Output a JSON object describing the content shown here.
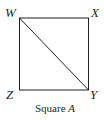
{
  "figure": {
    "shape": "square",
    "vertices": {
      "top_left": "W",
      "top_right": "X",
      "bottom_left": "Z",
      "bottom_right": "Y"
    },
    "diagonal": [
      "W",
      "Y"
    ],
    "caption": {
      "prefix": "Square",
      "name": "A"
    },
    "colors": {
      "stroke": "#231f20",
      "background": "#ffffff"
    }
  }
}
